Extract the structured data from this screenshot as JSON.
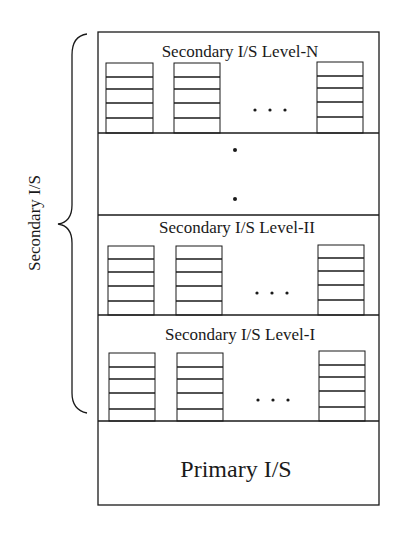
{
  "diagram": {
    "side_label": "Secondary I/S",
    "levels": [
      {
        "id": "level-n",
        "title": "Secondary I/S Level-N",
        "stacks": 3,
        "ellipsis": ". . ."
      },
      {
        "id": "gap",
        "title": "",
        "vertical_ellipsis": "•\n•"
      },
      {
        "id": "level-ii",
        "title": "Secondary I/S Level-II",
        "stacks": 3,
        "ellipsis": ". . ."
      },
      {
        "id": "level-i",
        "title": "Secondary I/S Level-I",
        "stacks": 3,
        "ellipsis": ". . ."
      }
    ],
    "primary": {
      "title": "Primary I/S"
    },
    "colors": {
      "line": "#1a1a1a",
      "background": "#ffffff"
    }
  }
}
